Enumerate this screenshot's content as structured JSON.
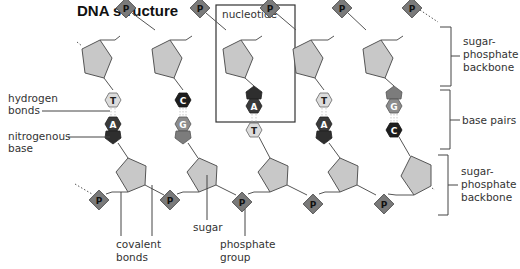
{
  "title": "DNA structure",
  "colors": {
    "sugar": "#c8c8c8",
    "stroke": "#555555",
    "phosphate": "#7a7a7a",
    "base_T": "#dcdcdc",
    "base_C": "#1e1e1e",
    "base_A": "#3a3a3a",
    "base_G": "#8c8c8c"
  },
  "labels": {
    "nucleotide": "nucleotide",
    "hydrogen_bonds": [
      "hydrogen",
      "bonds"
    ],
    "nitrogenous_base": [
      "nitrogenous",
      "base"
    ],
    "covalent_bonds": [
      "covalent",
      "bonds"
    ],
    "sugar": "sugar",
    "phosphate_group": [
      "phosphate",
      "group"
    ],
    "backbone_top": [
      "sugar-",
      "phosphate",
      "backbone"
    ],
    "base_pairs": "base pairs",
    "backbone_bottom": [
      "sugar-",
      "phosphate",
      "backbone"
    ]
  },
  "phosphate_symbol": "P",
  "top_strand_bases": [
    "T",
    "C",
    "A",
    "T",
    "G"
  ],
  "bottom_strand_bases": [
    "A",
    "G",
    "T",
    "A",
    "C"
  ],
  "base_pairs": [
    {
      "top": "T",
      "bottom": "A"
    },
    {
      "top": "C",
      "bottom": "G"
    },
    {
      "top": "A",
      "bottom": "T"
    },
    {
      "top": "T",
      "bottom": "A"
    },
    {
      "top": "G",
      "bottom": "C"
    }
  ]
}
